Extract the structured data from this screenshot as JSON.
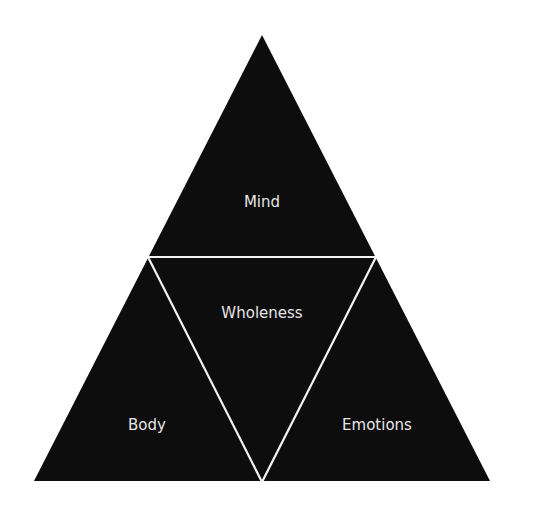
{
  "diagram": {
    "type": "triangle-partition",
    "colors": {
      "fill": "#0d0d0d",
      "separator": "#f2f2f2",
      "background": "#ffffff",
      "text": "#e6e6e6"
    },
    "sections": {
      "top": {
        "label": "Mind"
      },
      "center": {
        "label": "Wholeness"
      },
      "bottom_left": {
        "label": "Body"
      },
      "bottom_right": {
        "label": "Emotions"
      }
    }
  }
}
